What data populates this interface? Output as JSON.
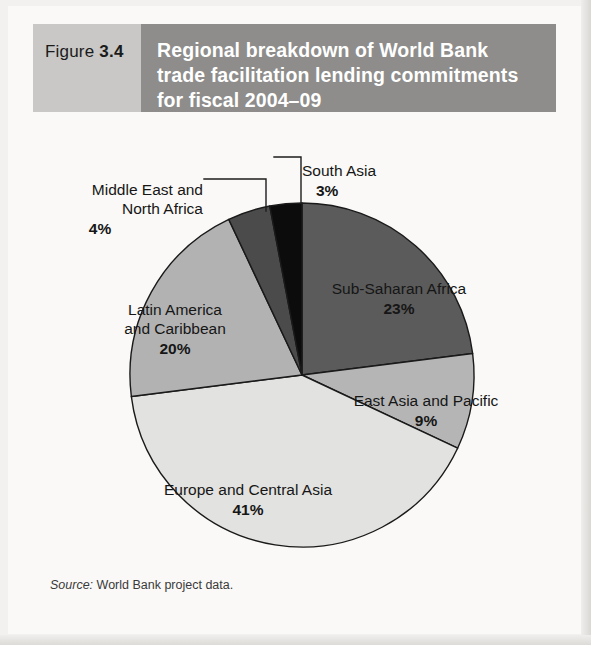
{
  "figure": {
    "number_word": "Figure",
    "number": "3.4",
    "title": "Regional breakdown of World Bank\ntrade facilitation lending commitments\nfor fiscal 2004–09",
    "source_label": "Source:",
    "source_text": " World Bank project data."
  },
  "colors": {
    "figure_number_box": "#c9c8c6",
    "figure_title_box": "#8e8d8b",
    "title_text": "#ffffff",
    "page_background": "#faf9f7",
    "slice_outline": "#1a1a1a",
    "label_text": "#161616"
  },
  "chart_data": {
    "type": "pie",
    "title": "Regional breakdown of World Bank trade facilitation lending commitments for fiscal 2004–09",
    "unit": "percent",
    "start_angle_deg": 0,
    "direction": "clockwise",
    "legend": "none (direct labels)",
    "categories": [
      "Sub-Saharan Africa",
      "East Asia and Pacific",
      "Europe and Central Asia",
      "Latin America and Caribbean",
      "Middle East and North Africa",
      "South Asia"
    ],
    "values": [
      23,
      9,
      41,
      20,
      4,
      3
    ],
    "slices": [
      {
        "label": "Sub-Saharan Africa",
        "label_lines": "Sub-Saharan Africa",
        "value": 23,
        "value_text": "23%",
        "color": "#5b5b5b",
        "label_placement": "inside",
        "leader_line": false
      },
      {
        "label": "East Asia and Pacific",
        "label_lines": "East Asia and Pacific",
        "value": 9,
        "value_text": "9%",
        "color": "#b5b5b5",
        "label_placement": "inside",
        "leader_line": false
      },
      {
        "label": "Europe and Central Asia",
        "label_lines": "Europe and Central Asia",
        "value": 41,
        "value_text": "41%",
        "color": "#e2e2e0",
        "label_placement": "inside",
        "leader_line": false
      },
      {
        "label": "Latin America and Caribbean",
        "label_lines": "Latin America\nand Caribbean",
        "value": 20,
        "value_text": "20%",
        "color": "#b2b2b2",
        "label_placement": "inside",
        "leader_line": false
      },
      {
        "label": "Middle East and North Africa",
        "label_lines": "Middle East and\nNorth Africa",
        "value": 4,
        "value_text": "4%",
        "color": "#4b4b4b",
        "label_placement": "outside-left",
        "leader_line": true
      },
      {
        "label": "South Asia",
        "label_lines": "South Asia",
        "value": 3,
        "value_text": "3%",
        "color": "#0c0c0c",
        "label_placement": "outside-top",
        "leader_line": true
      }
    ]
  }
}
